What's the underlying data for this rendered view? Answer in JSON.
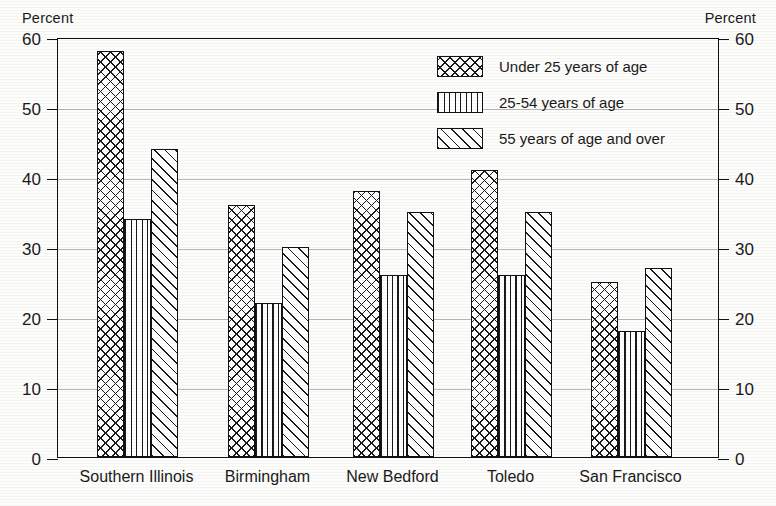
{
  "chart_data": {
    "type": "bar",
    "title": "",
    "xlabel": "",
    "ylabel": "Percent",
    "ylabel_right": "Percent",
    "ylim": [
      0,
      60
    ],
    "yticks": [
      0,
      10,
      20,
      30,
      40,
      50,
      60
    ],
    "ytick_labels": [
      "0",
      "10",
      "20",
      "30",
      "40",
      "50",
      "60"
    ],
    "grid": true,
    "legend_position": "upper right inside",
    "categories": [
      "Southern Illinois",
      "Birmingham",
      "New Bedford",
      "Toledo",
      "San Francisco"
    ],
    "series": [
      {
        "name": "Under 25 years of age",
        "pattern": "cross-hatch",
        "values": [
          58,
          36,
          38,
          41,
          25
        ]
      },
      {
        "name": "25-54 years of age",
        "pattern": "vertical-lines",
        "values": [
          34,
          22,
          26,
          26,
          18
        ]
      },
      {
        "name": "55 years of age and over",
        "pattern": "diagonal-lines",
        "values": [
          44,
          30,
          35,
          35,
          27
        ]
      }
    ]
  },
  "axes": {
    "left_caption": "Percent",
    "right_caption": "Percent"
  },
  "legend": {
    "items": [
      {
        "label": "Under 25 years of age"
      },
      {
        "label": "25-54 years of age"
      },
      {
        "label": "55 years of age and over"
      }
    ]
  },
  "colors": {
    "ink": "#1a1a1a",
    "frame": "#111111",
    "grid": "#b9b9b9",
    "paper": "#fdfdfb"
  }
}
